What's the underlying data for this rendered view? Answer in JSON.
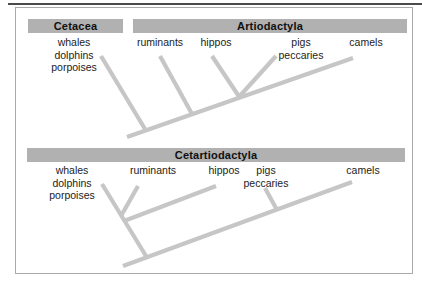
{
  "colors": {
    "header_bar": "#b1b1b1",
    "branch_line": "#c6c6c6",
    "figure_border": "#aaaaaa",
    "top_rule": "#4b4b4b",
    "text": "#1c1c1c"
  },
  "trees": [
    {
      "name": "traditional-classification",
      "headers": [
        {
          "label": "Cetacea"
        },
        {
          "label": "Artiodactyla"
        }
      ],
      "taxa": [
        {
          "lines": [
            "whales",
            "dolphins",
            "porpoises"
          ]
        },
        {
          "lines": [
            "ruminants"
          ]
        },
        {
          "lines": [
            "hippos"
          ]
        },
        {
          "lines": [
            "pigs",
            "peccaries"
          ]
        },
        {
          "lines": [
            "camels"
          ]
        }
      ],
      "topology": "(whales, (ruminants, ((hippos, pigs), camels)))"
    },
    {
      "name": "revised-classification",
      "headers": [
        {
          "label": "Cetartiodactyla"
        }
      ],
      "taxa": [
        {
          "lines": [
            "whales",
            "dolphins",
            "porpoises"
          ]
        },
        {
          "lines": [
            "ruminants"
          ]
        },
        {
          "lines": [
            "hippos"
          ]
        },
        {
          "lines": [
            "pigs",
            "peccaries"
          ]
        },
        {
          "lines": [
            "camels"
          ]
        }
      ],
      "topology": "(((whales, ruminants, hippos), pigs), camels)"
    }
  ]
}
